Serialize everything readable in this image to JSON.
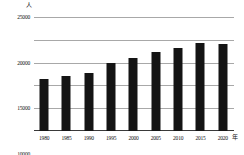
{
  "chart_data": {
    "type": "bar",
    "title": "",
    "xlabel": "年",
    "ylabel": "人",
    "categories": [
      "1980",
      "1985",
      "1990",
      "1995",
      "2000",
      "2005",
      "2010",
      "2015",
      "2020"
    ],
    "values": [
      11400,
      12000,
      12700,
      15000,
      16100,
      17300,
      18300,
      19200,
      19000
    ],
    "ylim": [
      0,
      25000
    ],
    "yticks": [
      0,
      5000,
      10000,
      15000,
      20000,
      25000
    ],
    "ytick_labels": [
      "0",
      "5000",
      "10000",
      "15000",
      "20000",
      "25000"
    ],
    "grid": true,
    "legend": false,
    "bar_color": "#141414"
  },
  "axis": {
    "y_unit": "人",
    "x_unit": "年"
  }
}
